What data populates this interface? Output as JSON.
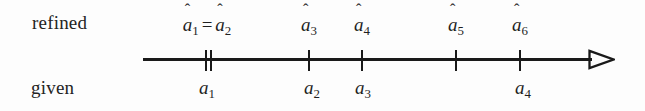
{
  "figure": {
    "row_labels": {
      "top": "refined",
      "bottom": "given"
    },
    "axis": {
      "start_x": 143,
      "end_x": 615,
      "y": 59,
      "arrow": "open-triangle-right",
      "color": "#1a1a1a"
    },
    "ticks": [
      {
        "x": 206,
        "kind": "double-left"
      },
      {
        "x": 210,
        "kind": "double-right"
      },
      {
        "x": 309,
        "kind": "single"
      },
      {
        "x": 362,
        "kind": "single"
      },
      {
        "x": 456,
        "kind": "single"
      },
      {
        "x": 520,
        "kind": "single"
      }
    ],
    "refined_points": [
      {
        "id": "a-hat-1-eq-a-hat-2",
        "hat1": "a",
        "sub1": "1",
        "eq": "=",
        "hat2": "a",
        "sub2": "2",
        "x": 207
      },
      {
        "id": "a-hat-3",
        "base": "a",
        "sub": "3",
        "x": 309
      },
      {
        "id": "a-hat-4",
        "base": "a",
        "sub": "4",
        "x": 362
      },
      {
        "id": "a-hat-5",
        "base": "a",
        "sub": "5",
        "x": 456
      },
      {
        "id": "a-hat-6",
        "base": "a",
        "sub": "6",
        "x": 520
      }
    ],
    "given_points": [
      {
        "id": "a-1",
        "base": "a",
        "sub": "1",
        "x": 207
      },
      {
        "id": "a-2",
        "base": "a",
        "sub": "2",
        "x": 312
      },
      {
        "id": "a-3",
        "base": "a",
        "sub": "3",
        "x": 363
      },
      {
        "id": "a-4",
        "base": "a",
        "sub": "4",
        "x": 523
      }
    ],
    "hat_glyph": "ˆ"
  }
}
